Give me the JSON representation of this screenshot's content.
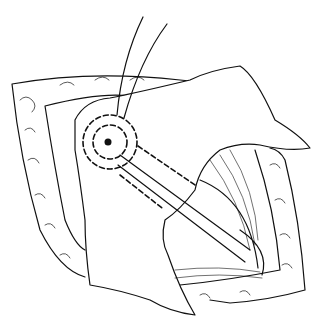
{
  "figure": {
    "type": "surgical-line-illustration",
    "background": "#ffffff",
    "stroke": "#111111",
    "elements": [
      "incision-frame",
      "fat-border",
      "tissue-flap",
      "suture-threads",
      "dashed-incision-circle",
      "dashed-incision-lines",
      "vessel-pedicle",
      "muscle-fibers"
    ]
  }
}
